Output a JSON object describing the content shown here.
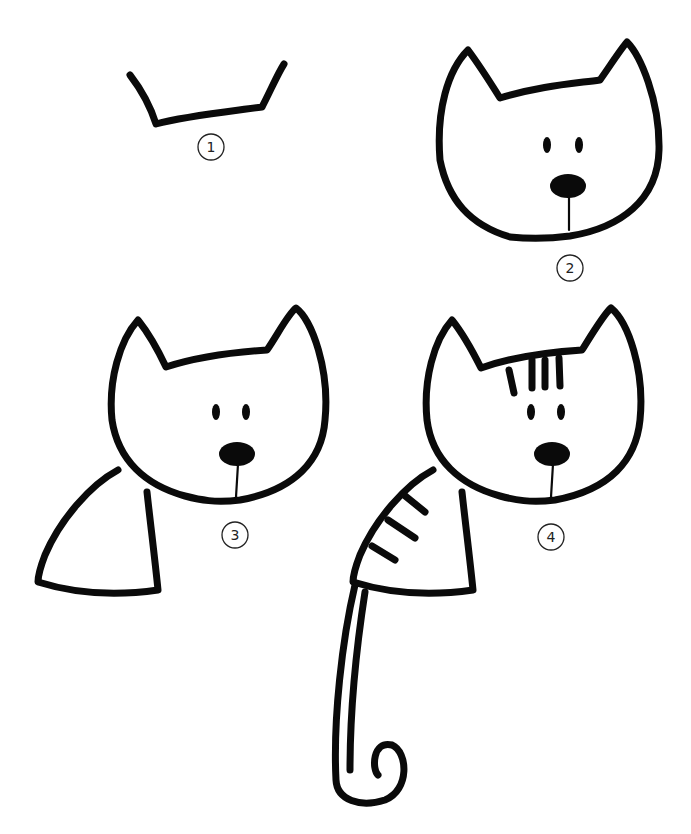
{
  "colors": {
    "ink": "#0a0a0a",
    "background": "#ffffff"
  },
  "steps": [
    {
      "number": "1",
      "description": "Head top with two ear strokes"
    },
    {
      "number": "2",
      "description": "Complete head with eyes, nose and mouth"
    },
    {
      "number": "3",
      "description": "Add the body"
    },
    {
      "number": "4",
      "description": "Add stripes and curled tail"
    }
  ]
}
